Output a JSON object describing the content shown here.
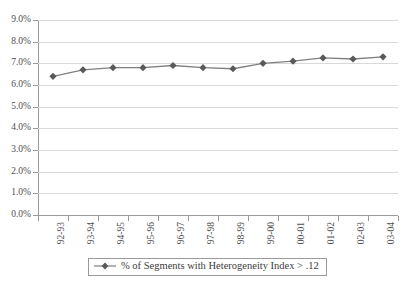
{
  "chart_data": {
    "type": "line",
    "title": "",
    "subtitle": "",
    "xlabel": "",
    "ylabel": "",
    "categories": [
      "92-93",
      "93-94",
      "94-95",
      "95-96",
      "96-97",
      "97-98",
      "98-99",
      "99-00",
      "00-01",
      "01-02",
      "02-03",
      "03-04"
    ],
    "values": [
      6.4,
      6.7,
      6.8,
      6.8,
      6.9,
      6.8,
      6.75,
      7.0,
      7.1,
      7.25,
      7.2,
      7.3
    ],
    "series": [
      {
        "name": "% of Segments with Heterogeneity Index > .12",
        "values": [
          6.4,
          6.7,
          6.8,
          6.8,
          6.9,
          6.8,
          6.75,
          7.0,
          7.1,
          7.25,
          7.2,
          7.3
        ]
      }
    ],
    "ylim": [
      0.0,
      9.0
    ],
    "ytick_labels": [
      "0.0%",
      "1.0%",
      "2.0%",
      "3.0%",
      "4.0%",
      "5.0%",
      "6.0%",
      "7.0%",
      "8.0%",
      "9.0%"
    ],
    "ytick_values": [
      0.0,
      1.0,
      2.0,
      3.0,
      4.0,
      5.0,
      6.0,
      7.0,
      8.0,
      9.0
    ],
    "grid": true,
    "legend": {
      "position": "bottom",
      "entries": [
        {
          "label": "% of Segments with Heterogeneity Index > .12",
          "marker": "diamond",
          "color": "#595959"
        }
      ]
    },
    "colors": {
      "line": "#808080",
      "marker": "#595959",
      "grid": "#d9d9d9",
      "axis": "#9a9a9a",
      "text": "#4f4f4f",
      "background": "#ffffff"
    }
  }
}
